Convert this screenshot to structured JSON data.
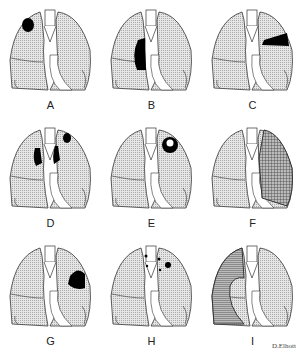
{
  "panels": [
    {
      "label": "A",
      "finding": "apical-mass-right"
    },
    {
      "label": "B",
      "finding": "hilar-mass-right"
    },
    {
      "label": "C",
      "finding": "upper-lobe-mass-left"
    },
    {
      "label": "D",
      "finding": "hilar-nodes-bilateral"
    },
    {
      "label": "E",
      "finding": "cavitating-mass-left"
    },
    {
      "label": "F",
      "finding": "consolidation-left"
    },
    {
      "label": "G",
      "finding": "peripheral-mass-left"
    },
    {
      "label": "H",
      "finding": "small-nodules"
    },
    {
      "label": "I",
      "finding": "effusion-right"
    }
  ],
  "signature": "D.Elhott",
  "colors": {
    "lung": "#d8d8d8",
    "outline": "#333333",
    "lesion": "#000000",
    "hatch": "#555555"
  }
}
